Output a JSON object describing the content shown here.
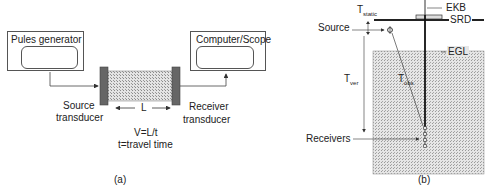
{
  "panel_a": {
    "pulse_generator_label": "Pules generator",
    "computer_scope_label": "Computer/Scope",
    "source_transducer_line1": "Source",
    "source_transducer_line2": "transducer",
    "receiver_transducer_line1": "Receiver",
    "receiver_transducer_line2": "transducer",
    "length_label": "L",
    "formula_line1": "V=L/t",
    "formula_line2": "t=travel time",
    "caption": "(a)"
  },
  "panel_b": {
    "t_static_main": "T",
    "t_static_sub": "static",
    "source_label": "Source",
    "t_ver_main": "T",
    "t_ver_sub": "ver",
    "t_obs_main": "T",
    "t_obs_sub": "obs",
    "ekb_label": "EKB",
    "srd_label": "SRD",
    "egl_label": "EGL",
    "receivers_label": "Receivers",
    "caption": "(b)"
  },
  "colors": {
    "line": "#333333",
    "box_border": "#555555",
    "transducer": "#666666",
    "sample_fill": "#c8c8c8",
    "ground_fill": "#d0d0d0"
  }
}
